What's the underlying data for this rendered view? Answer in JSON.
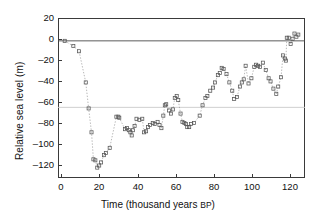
{
  "chart_data": {
    "type": "scatter",
    "title": "",
    "xlabel": "Time (thousand years BP)",
    "ylabel": "Relative sea level (m)",
    "xlim": [
      -3,
      126
    ],
    "ylim": [
      -132,
      22
    ],
    "xticks": [
      0,
      20,
      40,
      60,
      80,
      100,
      120
    ],
    "yticks": [
      20,
      0,
      -20,
      -40,
      -60,
      -80,
      -100,
      -120
    ],
    "grid": false,
    "legend": null,
    "marker": "open-square",
    "linestyle": "dotted",
    "line_color": "#9a9a9a",
    "marker_color": "#555555",
    "reference_lines": [
      {
        "name": "present-sea-level",
        "y": 0,
        "color": "#4a4a4a"
      },
      {
        "name": "lgm-shelf-level",
        "y": -64,
        "color": "#c9c9c9"
      }
    ],
    "x": [
      0.5,
      5,
      8,
      11.5,
      13,
      14.5,
      15.5,
      16.5,
      17.5,
      18.5,
      19.5,
      21,
      22,
      24,
      27.5,
      28.5,
      29,
      32,
      33,
      34,
      34.8,
      35.5,
      36.2,
      37,
      38,
      39.5,
      41,
      42,
      43,
      44,
      45,
      46.5,
      47.5,
      49,
      50,
      51,
      52,
      52.8,
      53.5,
      55,
      56,
      57,
      58,
      59,
      59.8,
      61,
      62,
      63,
      63.8,
      64.5,
      65.5,
      66.5,
      68,
      71,
      72.5,
      74,
      75,
      76.5,
      78,
      79,
      80.5,
      81.5,
      82.5,
      83.5,
      85,
      86.5,
      88,
      89,
      90.5,
      92,
      93,
      94,
      95,
      96.5,
      98,
      99.5,
      100.5,
      101.5,
      102.5,
      104,
      105.5,
      107,
      108,
      109.5,
      111,
      112,
      113.5,
      114.5,
      115.5,
      116,
      116.5,
      117.5,
      118.5,
      119.5,
      120.5,
      121.5,
      122.5
    ],
    "y": [
      0,
      -5,
      -10,
      -40,
      -65,
      -88,
      -114,
      -115,
      -122,
      -120,
      -117,
      -110,
      -108,
      -103,
      -73,
      -73,
      -74,
      -85,
      -84,
      -86,
      -88,
      -91,
      -86,
      -82,
      -75,
      -76,
      -75,
      -88,
      -87,
      -83,
      -81,
      -79,
      -80,
      -78,
      -81,
      -84,
      -72,
      -62,
      -61,
      -67,
      -70,
      -66,
      -55,
      -53,
      -57,
      -70,
      -78,
      -79,
      -80,
      -83,
      -83,
      -80,
      -79,
      -72,
      -62,
      -55,
      -53,
      -48,
      -45,
      -40,
      -33,
      -31,
      -26,
      -27,
      -32,
      -40,
      -48,
      -56,
      -54,
      -44,
      -40,
      -37,
      -24,
      -41,
      -36,
      -25,
      -23,
      -24,
      -25,
      -21,
      -28,
      -36,
      -39,
      -46,
      -51,
      -44,
      -35,
      -14,
      -17,
      -19,
      3,
      3,
      -3,
      2,
      7,
      4,
      6
    ]
  },
  "axis": {
    "x_tick_labels": [
      "0",
      "20",
      "40",
      "60",
      "80",
      "100",
      "120"
    ],
    "y_tick_labels": [
      "20",
      "0",
      "–20",
      "–40",
      "–60",
      "–80",
      "–100",
      "–120"
    ],
    "x_title_main": "Time (thousand years ",
    "x_title_bp": "BP",
    "x_title_close": ")",
    "y_title": "Relative sea level (m)"
  }
}
